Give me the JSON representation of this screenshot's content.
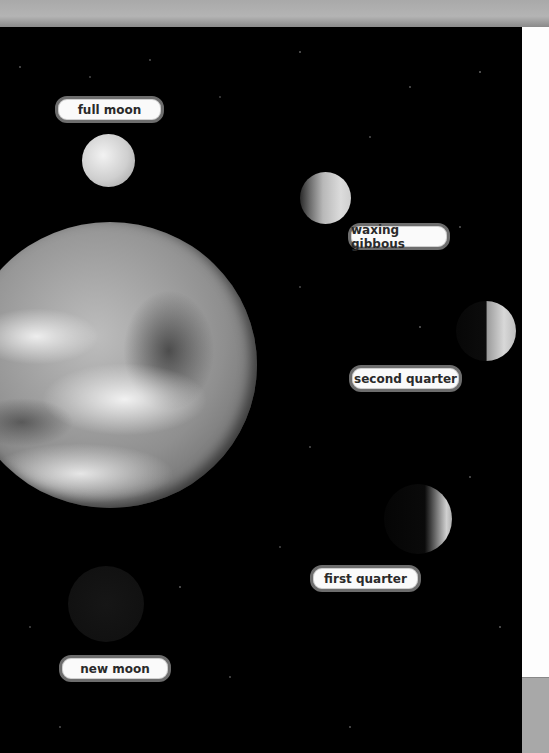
{
  "figure": {
    "colors": {
      "space": "#000000",
      "label_background": "#fafafa",
      "label_border": "#6d6d6d",
      "label_text": "#2a2a2a",
      "top_bar": "#b0b0b0",
      "right_panel": "#fdfdfd"
    },
    "bodies": [
      {
        "name": "earth",
        "type": "planet"
      },
      {
        "name": "full-moon",
        "type": "moon",
        "phase": "full"
      },
      {
        "name": "waxing-gibbous-moon",
        "type": "moon",
        "phase": "waxing gibbous"
      },
      {
        "name": "second-quarter-moon",
        "type": "moon",
        "phase": "second quarter"
      },
      {
        "name": "first-quarter-moon",
        "type": "moon",
        "phase": "first quarter"
      },
      {
        "name": "new-moon",
        "type": "moon",
        "phase": "new"
      }
    ],
    "labels": {
      "full_moon": "full moon",
      "waxing_gibbous": "waxing gibbous",
      "second_quarter": "second quarter",
      "first_quarter": "first quarter",
      "new_moon": "new moon"
    }
  }
}
